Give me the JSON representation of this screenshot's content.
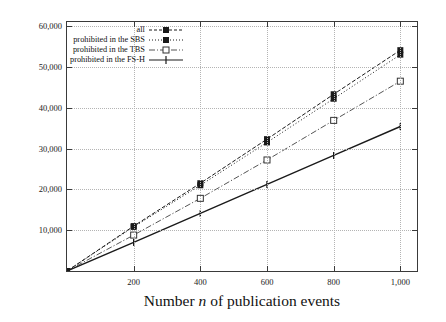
{
  "chart_data": {
    "type": "line",
    "title": "",
    "xlabel": "Number n of publication events",
    "ylabel": "Number of event messages",
    "x": [
      0,
      200,
      400,
      600,
      800,
      1000
    ],
    "xlim": [
      0,
      1050
    ],
    "ylim": [
      0,
      61000
    ],
    "xticks": [
      200,
      400,
      600,
      800,
      1000
    ],
    "xticklabels": [
      "200",
      "400",
      "600",
      "800",
      "1,000"
    ],
    "yticks": [
      10000,
      20000,
      30000,
      40000,
      50000,
      60000
    ],
    "yticklabels": [
      "10,000",
      "20,000",
      "30,000",
      "40,000",
      "50,000",
      "60,000"
    ],
    "grid": true,
    "legend_position": "upper-left",
    "series": [
      {
        "name": "all",
        "values": [
          0,
          11000,
          21500,
          32300,
          43300,
          54100
        ],
        "linestyle": "dashed",
        "marker": "filled-square",
        "color": "#1a1a1a"
      },
      {
        "name": "prohibited in the SBS",
        "values": [
          0,
          10800,
          21000,
          31500,
          42200,
          53000
        ],
        "linestyle": "dotted",
        "marker": "filled-square",
        "color": "#1a1a1a"
      },
      {
        "name": "prohibited in the TBS",
        "values": [
          0,
          8800,
          17800,
          27200,
          36900,
          46500
        ],
        "linestyle": "dash-dot",
        "marker": "open-square",
        "color": "#555555"
      },
      {
        "name": "prohibited in the FS-H",
        "values": [
          0,
          7000,
          14100,
          21200,
          28300,
          35400
        ],
        "linestyle": "solid",
        "marker": "plus",
        "color": "#1a1a1a"
      }
    ]
  },
  "legend": {
    "items": [
      {
        "label": "all"
      },
      {
        "label": "prohibited in the SBS"
      },
      {
        "label": "prohibited in the TBS"
      },
      {
        "label": "prohibited in the FS-H"
      }
    ]
  },
  "axes": {
    "x_title_prefix": "Number ",
    "x_title_italic": "n",
    "x_title_suffix": " of publication events",
    "y_title": "Number of event messages"
  }
}
